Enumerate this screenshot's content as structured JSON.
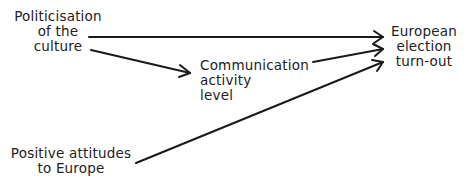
{
  "diagram": {
    "type": "path-diagram",
    "nodes": {
      "politicisation": {
        "lines": [
          "Politicisation",
          "of the",
          "culture"
        ]
      },
      "communication": {
        "lines": [
          "Communication",
          "activity",
          "level"
        ]
      },
      "turnout": {
        "lines": [
          "European",
          "election",
          "turn-out"
        ]
      },
      "attitudes": {
        "lines": [
          "Positive attitudes",
          "to Europe"
        ]
      }
    },
    "edges": [
      {
        "from": "Politicisation of the culture",
        "to": "European election turn-out"
      },
      {
        "from": "Politicisation of the culture",
        "to": "Communication activity level"
      },
      {
        "from": "Communication activity level",
        "to": "European election turn-out"
      },
      {
        "from": "Positive attitudes to Europe",
        "to": "European election turn-out"
      }
    ],
    "colors": {
      "line": "#1a1a1a",
      "text": "#222222",
      "background": "#ffffff"
    }
  }
}
